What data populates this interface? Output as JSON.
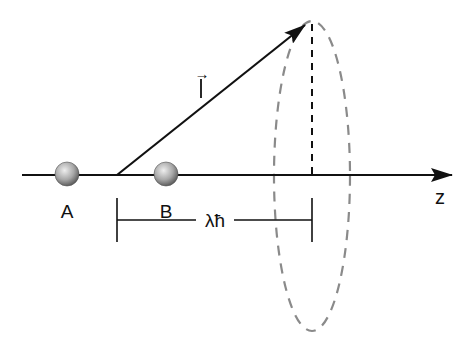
{
  "diagram": {
    "axis_label": "z",
    "vector_label": "l",
    "vector_arrow_glyph": "→",
    "particle_a_label": "A",
    "particle_b_label": "B",
    "distance_label": "λħ",
    "colors": {
      "line": "#111111",
      "dashed": "#888888",
      "sphere_light": "#e6e6e6",
      "sphere_dark": "#6e6e6e"
    }
  }
}
